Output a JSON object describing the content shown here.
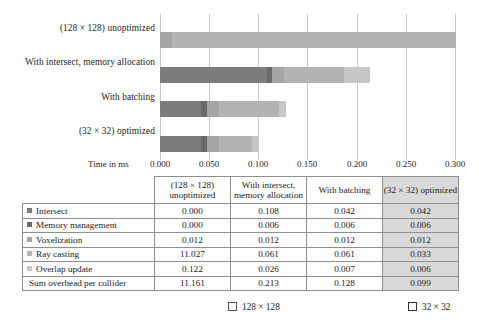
{
  "chart_data": {
    "type": "bar",
    "orientation": "horizontal",
    "stacked": true,
    "title": "",
    "xlabel": "Time in ms",
    "ylabel": "",
    "xlim": [
      0.0,
      0.3
    ],
    "grid": true,
    "legend_position": "bottom",
    "xticks": [
      "0.000",
      "0.050",
      "0.100",
      "0.150",
      "0.200",
      "0.250",
      "0.300"
    ],
    "xtick_values": [
      0.0,
      0.05,
      0.1,
      0.15,
      0.2,
      0.25,
      0.3
    ],
    "categories": [
      "(128 × 128) unoptimized",
      "With intersect, memory allocation",
      "With batching",
      "(32 × 32) optimized"
    ],
    "series": [
      {
        "name": "Intersect",
        "color": "#7c7c7c",
        "values": [
          0.0,
          0.108,
          0.042,
          0.042
        ]
      },
      {
        "name": "Memory management",
        "color": "#6b6b6b",
        "values": [
          0.0,
          0.006,
          0.006,
          0.006
        ]
      },
      {
        "name": "Voxelization",
        "color": "#a5a5a5",
        "values": [
          0.012,
          0.012,
          0.012,
          0.012
        ]
      },
      {
        "name": "Ray casting",
        "color": "#b3b3b3",
        "values": [
          11.027,
          0.061,
          0.061,
          0.033
        ]
      },
      {
        "name": "Overlap update",
        "color": "#c6c6c6",
        "values": [
          0.122,
          0.026,
          0.007,
          0.006
        ]
      }
    ],
    "totals": [
      11.161,
      0.213,
      0.128,
      0.099
    ],
    "note_clipped": "First bar is clipped at the 0.300 axis maximum"
  },
  "table": {
    "row_header_label": "",
    "columns": [
      "(128 × 128) unoptimized",
      "With intersect, memory allocation",
      "With batching",
      "(32 × 32) optimized"
    ],
    "rows": [
      {
        "label": "Intersect",
        "swatch": "#7c7c7c",
        "values": [
          "0.000",
          "0.108",
          "0.042",
          "0.042"
        ]
      },
      {
        "label": "Memory management",
        "swatch": "#6b6b6b",
        "values": [
          "0.000",
          "0.006",
          "0.006",
          "0.006"
        ]
      },
      {
        "label": "Voxelization",
        "swatch": "#a5a5a5",
        "values": [
          "0.012",
          "0.012",
          "0.012",
          "0.012"
        ]
      },
      {
        "label": "Ray casting",
        "swatch": "#b3b3b3",
        "values": [
          "11.027",
          "0.061",
          "0.061",
          "0.033"
        ]
      },
      {
        "label": "Overlap update",
        "swatch": "#c6c6c6",
        "values": [
          "0.122",
          "0.026",
          "0.007",
          "0.006"
        ]
      },
      {
        "label": "Sum overhead per collider",
        "swatch": null,
        "values": [
          "11.161",
          "0.213",
          "0.128",
          "0.099"
        ]
      }
    ],
    "shaded_column_index": 3,
    "shaded_column_color": "#d9d9d9"
  },
  "legend": {
    "items": [
      {
        "label": "128 × 128",
        "marker_fill": "#ffffff",
        "marker_border": "#666666"
      },
      {
        "label": "32 × 32",
        "marker_fill": "#ffffff",
        "marker_border": "#333333"
      }
    ]
  },
  "colors": {
    "gridline": "#c9c9c9",
    "table_border": "#8f8f8f",
    "text": "#1c1c1c",
    "background": "#ffffff"
  }
}
